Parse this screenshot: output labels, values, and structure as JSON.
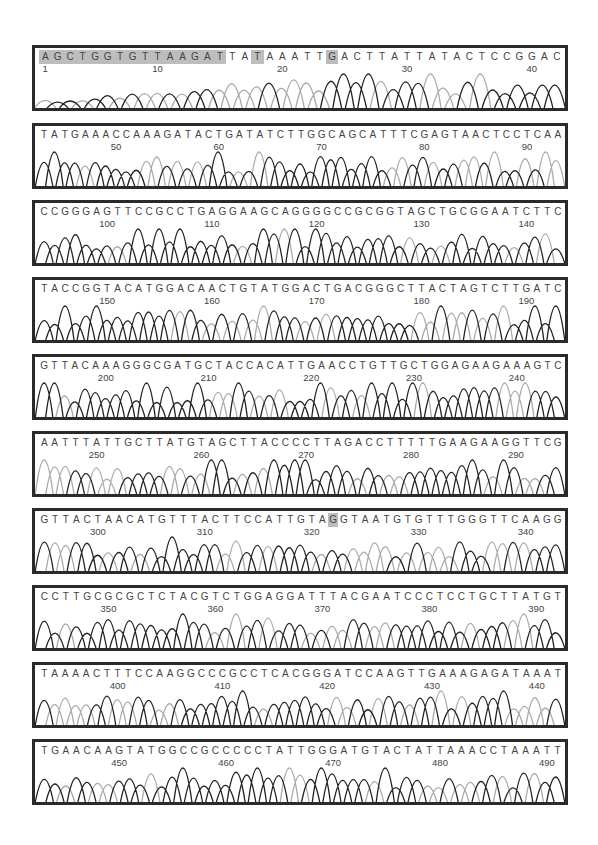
{
  "chart_data": {
    "type": "line",
    "xlabel": "base position",
    "ylabel": "fluorescence intensity",
    "grid": false,
    "legend": "none",
    "highlight_color": "#bdbdbd",
    "trace_colors": {
      "dark": "#222222",
      "light": "#aaaaaa"
    },
    "panels": [
      {
        "sequence": "AGCTGGTGTTAAGATTATAAATTGACTTATTATACTCCGGAC",
        "start": 1,
        "ticks": [
          1,
          10,
          20,
          30,
          40
        ],
        "highlighted_ranges": [
          [
            1,
            15
          ],
          [
            18,
            18
          ],
          [
            24,
            24
          ]
        ]
      },
      {
        "sequence": "TATGAAACCAAAGATACTGATATCTTGGCAGCATTTCGAGTAACTCCTCAA",
        "start": 43,
        "ticks": [
          50,
          60,
          70,
          80,
          90
        ]
      },
      {
        "sequence": "CCGGGAGTTCCGCCTGAGGAAGCAGGGGCCGCGGTAGCTGCGGAATCTTC",
        "start": 94,
        "ticks": [
          100,
          110,
          120,
          130,
          140
        ]
      },
      {
        "sequence": "TACCGGTACATGGACAACTGTATGGACTGACGGGCTTACTAGTCTTGATC",
        "start": 144,
        "ticks": [
          150,
          160,
          170,
          180,
          190
        ]
      },
      {
        "sequence": "GTTACAAAGGGCGATGCTACCACATTGAACCTGTTGCTGGAGAAGAAAGTC",
        "start": 194,
        "ticks": [
          200,
          210,
          220,
          230,
          240
        ]
      },
      {
        "sequence": "AATTTATTGCTTATGTAGCTTACCCCTTAGACCTTTTTGAAGAAGGTTCG",
        "start": 245,
        "ticks": [
          250,
          260,
          270,
          280,
          290
        ]
      },
      {
        "sequence": "GTTACTAACATGTTTACTTCCATTGTAGGTAATGTGTTTGGGTTCAAGG",
        "start": 295,
        "ticks": [
          300,
          310,
          320,
          330,
          340
        ],
        "highlighted_ranges": [
          [
            322,
            322
          ]
        ]
      },
      {
        "sequence": "CCTTGCGCGCTCTACGTCTGGAGGATTTACGAATCCCTCCTGCTTATGT",
        "start": 344,
        "ticks": [
          350,
          360,
          370,
          380,
          390
        ]
      },
      {
        "sequence": "TAAAACTTTCCAAGGCCCGCCTCACGGGATCCAAGTTGAAAGAGATAAAT",
        "start": 393,
        "ticks": [
          400,
          410,
          420,
          430,
          440
        ]
      },
      {
        "sequence": "TGAACAAGTATGGCCGCCCCCTATTGGGATGTACTATTAAACCTAAATT",
        "start": 443,
        "ticks": [
          450,
          460,
          470,
          480,
          490
        ]
      }
    ]
  }
}
